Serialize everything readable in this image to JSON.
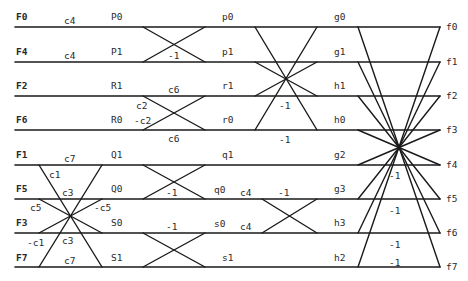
{
  "diagram": {
    "type": "signal-flow butterfly (8-point inverse DCT)",
    "inputs": [
      "F0",
      "F4",
      "F2",
      "F6",
      "F1",
      "F5",
      "F3",
      "F7"
    ],
    "stage1_nodes": [
      "P0",
      "P1",
      "R1",
      "R0",
      "Q1",
      "Q0",
      "S0",
      "S1"
    ],
    "stage2_nodes": [
      "p0",
      "p1",
      "r1",
      "r0",
      "q1",
      "q0",
      "s0",
      "s1"
    ],
    "stage3_nodes": [
      "g0",
      "g1",
      "h1",
      "h0",
      "g2",
      "g3",
      "h3",
      "h2"
    ],
    "outputs": [
      "f0",
      "f1",
      "f2",
      "f3",
      "f4",
      "f5",
      "f6",
      "f7"
    ],
    "coefficients": {
      "c4_a": "c4",
      "c4_b": "c4",
      "c6_top": "c6",
      "c6_bot": "c6",
      "c2_pos": "c2",
      "c2_neg": "-c2",
      "c7_top": "c7",
      "c7_bot": "c7",
      "c1_pos": "c1",
      "c1_neg": "-c1",
      "c3_top": "c3",
      "c3_bot": "c3",
      "c5_pos": "c5",
      "c5_neg": "-c5",
      "c4_q0": "c4",
      "c4_s0": "c4"
    },
    "negations": {
      "p_butterfly": "-1",
      "q_butterfly": "-1",
      "s_butterfly": "-1",
      "qs_butterfly": "-1",
      "pr_mid": "-1",
      "pr_bot": "-1",
      "out_f4": "-1",
      "out_f5": "-1",
      "out_f6": "-1",
      "out_f7": "-1"
    }
  }
}
